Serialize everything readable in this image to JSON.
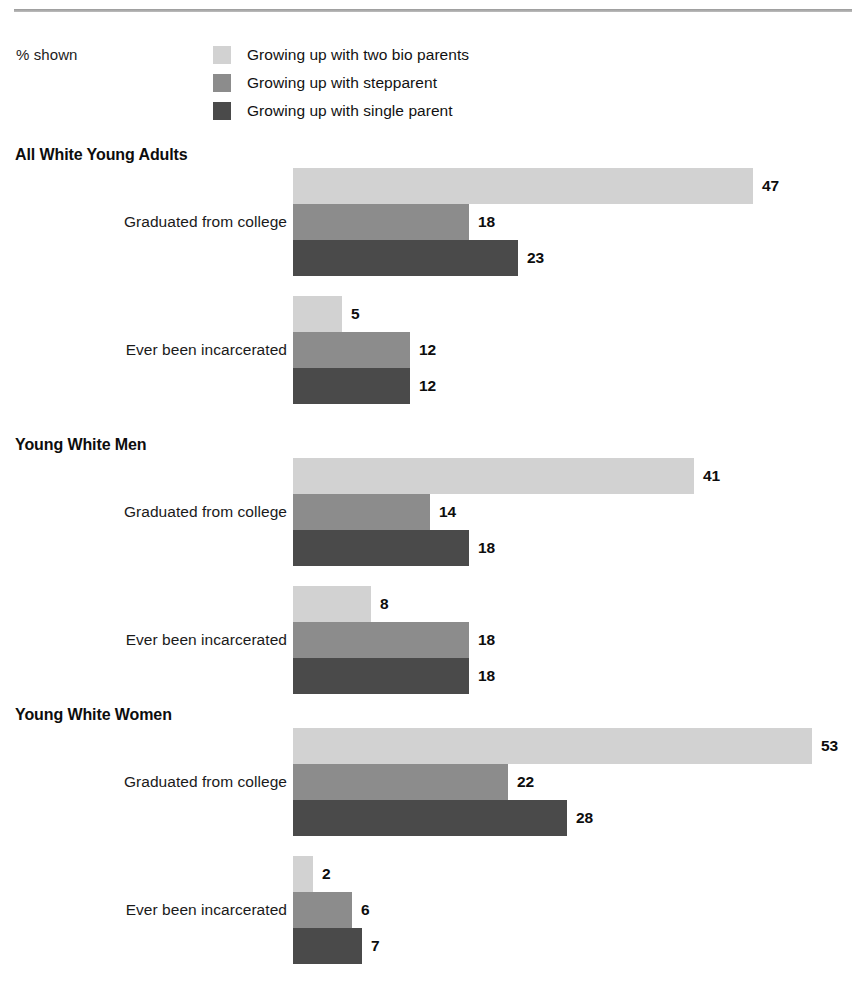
{
  "legend": {
    "units_label": "% shown",
    "items": [
      {
        "label": "Growing up with two bio parents",
        "color": "#d2d2d2",
        "swatch_name": "legend-swatch-two-bio-parents"
      },
      {
        "label": "Growing up with stepparent",
        "color": "#8c8c8c",
        "swatch_name": "legend-swatch-stepparent"
      },
      {
        "label": "Growing up with single parent",
        "color": "#4a4a4a",
        "swatch_name": "legend-swatch-single-parent"
      }
    ]
  },
  "sections": [
    {
      "title": "All White Young Adults",
      "groups": [
        {
          "label": "Graduated from college",
          "bars": [
            {
              "series": "Growing up with two bio parents",
              "value": 47,
              "value_label": "47",
              "color": "#d2d2d2"
            },
            {
              "series": "Growing up with stepparent",
              "value": 18,
              "value_label": "18",
              "color": "#8c8c8c"
            },
            {
              "series": "Growing up with single parent",
              "value": 23,
              "value_label": "23",
              "color": "#4a4a4a"
            }
          ]
        },
        {
          "label": "Ever been incarcerated",
          "bars": [
            {
              "series": "Growing up with two bio parents",
              "value": 5,
              "value_label": "5",
              "color": "#d2d2d2"
            },
            {
              "series": "Growing up with stepparent",
              "value": 12,
              "value_label": "12",
              "color": "#8c8c8c"
            },
            {
              "series": "Growing up with single parent",
              "value": 12,
              "value_label": "12",
              "color": "#4a4a4a"
            }
          ]
        }
      ]
    },
    {
      "title": "Young White Men",
      "groups": [
        {
          "label": "Graduated from college",
          "bars": [
            {
              "series": "Growing up with two bio parents",
              "value": 41,
              "value_label": "41",
              "color": "#d2d2d2"
            },
            {
              "series": "Growing up with stepparent",
              "value": 14,
              "value_label": "14",
              "color": "#8c8c8c"
            },
            {
              "series": "Growing up with single parent",
              "value": 18,
              "value_label": "18",
              "color": "#4a4a4a"
            }
          ]
        },
        {
          "label": "Ever been incarcerated",
          "bars": [
            {
              "series": "Growing up with two bio parents",
              "value": 8,
              "value_label": "8",
              "color": "#d2d2d2"
            },
            {
              "series": "Growing up with stepparent",
              "value": 18,
              "value_label": "18",
              "color": "#8c8c8c"
            },
            {
              "series": "Growing up with single parent",
              "value": 18,
              "value_label": "18",
              "color": "#4a4a4a"
            }
          ]
        }
      ]
    },
    {
      "title": "Young White Women",
      "groups": [
        {
          "label": "Graduated from college",
          "bars": [
            {
              "series": "Growing up with two bio parents",
              "value": 53,
              "value_label": "53",
              "color": "#d2d2d2"
            },
            {
              "series": "Growing up with stepparent",
              "value": 22,
              "value_label": "22",
              "color": "#8c8c8c"
            },
            {
              "series": "Growing up with single parent",
              "value": 28,
              "value_label": "28",
              "color": "#4a4a4a"
            }
          ]
        },
        {
          "label": "Ever been incarcerated",
          "bars": [
            {
              "series": "Growing up with two bio parents",
              "value": 2,
              "value_label": "2",
              "color": "#d2d2d2"
            },
            {
              "series": "Growing up with stepparent",
              "value": 6,
              "value_label": "6",
              "color": "#8c8c8c"
            },
            {
              "series": "Growing up with single parent",
              "value": 7,
              "value_label": "7",
              "color": "#4a4a4a"
            }
          ]
        }
      ]
    }
  ],
  "chart_data": {
    "type": "bar",
    "orientation": "horizontal",
    "title": "",
    "xlabel": "",
    "ylabel": "",
    "units": "% shown",
    "grid": false,
    "legend_position": "top",
    "xlim": [
      0,
      53
    ],
    "pixels_per_unit": 9.79,
    "bar_origin_x": 293,
    "series": [
      {
        "name": "Growing up with two bio parents",
        "color": "#d2d2d2"
      },
      {
        "name": "Growing up with stepparent",
        "color": "#8c8c8c"
      },
      {
        "name": "Growing up with single parent",
        "color": "#4a4a4a"
      }
    ],
    "panels": [
      {
        "name": "All White Young Adults",
        "categories": [
          "Graduated from college",
          "Ever been incarcerated"
        ],
        "values": {
          "Growing up with two bio parents": [
            47,
            5
          ],
          "Growing up with stepparent": [
            18,
            12
          ],
          "Growing up with single parent": [
            23,
            12
          ]
        }
      },
      {
        "name": "Young White Men",
        "categories": [
          "Graduated from college",
          "Ever been incarcerated"
        ],
        "values": {
          "Growing up with two bio parents": [
            41,
            8
          ],
          "Growing up with stepparent": [
            14,
            18
          ],
          "Growing up with single parent": [
            18,
            18
          ]
        }
      },
      {
        "name": "Young White Women",
        "categories": [
          "Graduated from college",
          "Ever been incarcerated"
        ],
        "values": {
          "Growing up with two bio parents": [
            53,
            2
          ],
          "Growing up with stepparent": [
            22,
            6
          ],
          "Growing up with single parent": [
            28,
            7
          ]
        }
      }
    ]
  },
  "layout": {
    "section_tops": [
      146,
      436,
      706
    ],
    "group_offsets": [
      22,
      150
    ],
    "bar_height": 36
  }
}
